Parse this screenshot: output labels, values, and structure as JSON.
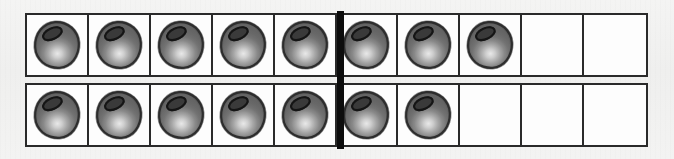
{
  "worksheet": {
    "title": "Double Ten-Frame",
    "description": "Two ten-frames, each of 10 cells split into groups of five by a heavy vertical divider, filled with round counters.",
    "background_color": "#f1f1f0",
    "frame_border_color": "#2a2a2a",
    "cell_fill_color": "#fdfdfd",
    "divider_color": "#0d0d0d",
    "counter_color": "#6e6e6e",
    "counter_outline_color": "#2d2d2d",
    "counter_highlight_color": "#e8e8e8",
    "counter_hole_color": "#3a3a3a"
  },
  "chart_data": {
    "type": "table",
    "xlabel": "",
    "ylabel": "",
    "columns_per_row": 10,
    "group_split_after_column": 5,
    "categories": [
      "Top ten-frame",
      "Bottom ten-frame"
    ],
    "values": [
      8,
      7
    ],
    "total": 15,
    "max_per_row": 10,
    "series": [
      {
        "name": "Top ten-frame",
        "filled": 8,
        "empty": 2,
        "cells": [
          "counter",
          "counter",
          "counter",
          "counter",
          "counter",
          "counter",
          "counter",
          "counter",
          "empty",
          "empty"
        ]
      },
      {
        "name": "Bottom ten-frame",
        "filled": 7,
        "empty": 3,
        "cells": [
          "counter",
          "counter",
          "counter",
          "counter",
          "counter",
          "counter",
          "counter",
          "empty",
          "empty",
          "empty"
        ]
      }
    ],
    "grid": true,
    "legend": "none"
  },
  "icons": {
    "counter": "counter-chip-icon",
    "divider": "frame-divider"
  }
}
